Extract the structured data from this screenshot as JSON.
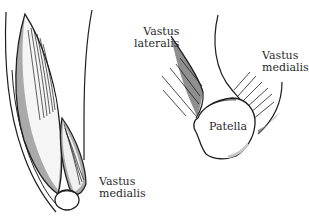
{
  "figure": {
    "background": "#ffffff",
    "stroke_color": "#1e1e1e",
    "shade_color": "#a9a9a9",
    "light_shade_color": "#d0d0d0",
    "left_panel": {
      "label_vastus_medialis": {
        "line1": "Vastus",
        "line2": "medialis"
      }
    },
    "right_panel": {
      "label_vastus_lateralis": {
        "line1": "Vastus",
        "line2": "lateralis"
      },
      "label_vastus_medialis": {
        "line1": "Vastus",
        "line2": "medialis"
      },
      "label_patella": "Patella"
    }
  }
}
